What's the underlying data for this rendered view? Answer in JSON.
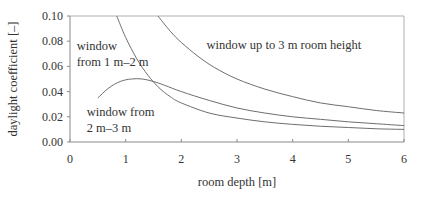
{
  "chart_data": {
    "type": "line",
    "title": "",
    "xlabel": "room depth [m]",
    "ylabel": "daylight coefficient [–]",
    "xlim": [
      0,
      6
    ],
    "ylim": [
      0,
      0.1
    ],
    "xticks": [
      0,
      1,
      2,
      3,
      4,
      5,
      6
    ],
    "xtick_labels": [
      "0",
      "1",
      "2",
      "3",
      "4",
      "5",
      "6"
    ],
    "yticks": [
      0,
      0.02,
      0.04,
      0.06,
      0.08,
      0.1
    ],
    "ytick_labels": [
      "0.00",
      "0.02",
      "0.04",
      "0.06",
      "0.08",
      "0.10"
    ],
    "grid": false,
    "legend": "none",
    "series": [
      {
        "name": "window from 1 m–2 m",
        "x": [
          0.84,
          1.0,
          1.2,
          1.4,
          1.6,
          1.8,
          2.0,
          2.5,
          3.0,
          3.5,
          4.0,
          4.5,
          5.0,
          5.5,
          6.0
        ],
        "y": [
          0.1,
          0.083,
          0.066,
          0.053,
          0.043,
          0.036,
          0.031,
          0.023,
          0.019,
          0.016,
          0.014,
          0.0125,
          0.0115,
          0.0105,
          0.01
        ]
      },
      {
        "name": "window up to 3 m room height",
        "x": [
          1.58,
          1.8,
          2.0,
          2.3,
          2.6,
          3.0,
          3.5,
          4.0,
          4.5,
          5.0,
          5.5,
          6.0
        ],
        "y": [
          0.1,
          0.088,
          0.079,
          0.068,
          0.059,
          0.05,
          0.042,
          0.036,
          0.031,
          0.028,
          0.025,
          0.023
        ]
      },
      {
        "name": "window from 2 m–3 m",
        "x": [
          0.5,
          0.7,
          0.9,
          1.1,
          1.3,
          1.5,
          1.7,
          2.0,
          2.5,
          3.0,
          3.5,
          4.0,
          4.5,
          5.0,
          5.5,
          6.0
        ],
        "y": [
          0.035,
          0.043,
          0.048,
          0.05,
          0.05,
          0.048,
          0.045,
          0.04,
          0.033,
          0.027,
          0.023,
          0.02,
          0.018,
          0.016,
          0.0145,
          0.013
        ]
      }
    ],
    "annotations": [
      {
        "text_lines": [
          "window",
          "from 1 m–2 m"
        ],
        "x": 0.12,
        "y": 0.073
      },
      {
        "text_lines": [
          "window up to 3 m room height"
        ],
        "x": 2.45,
        "y": 0.074
      },
      {
        "text_lines": [
          "window from",
          "2 m–3 m"
        ],
        "x": 0.3,
        "y": 0.021
      }
    ]
  }
}
